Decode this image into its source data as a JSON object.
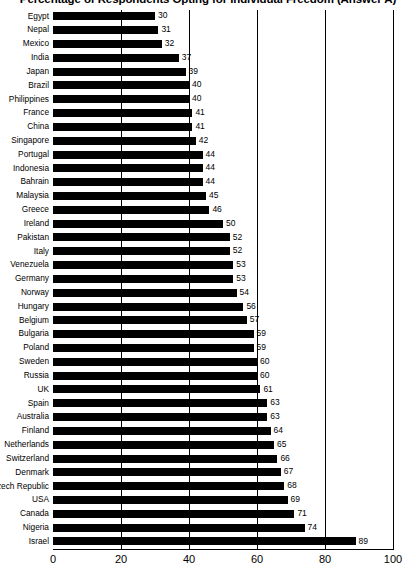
{
  "chart_data": {
    "type": "bar",
    "orientation": "horizontal",
    "title": "Percentage of Respondents Opting for Individual Freedom (Answer A)",
    "xlabel": "",
    "ylabel": "",
    "xlim": [
      0,
      100
    ],
    "xticks": [
      0,
      20,
      40,
      60,
      80,
      100
    ],
    "grid": true,
    "grid_axis": "x",
    "legend": false,
    "bar_color": "#000000",
    "background_color": "#ffffff",
    "show_value_labels": true,
    "categories": [
      "Egypt",
      "Nepal",
      "Mexico",
      "India",
      "Japan",
      "Brazil",
      "Philippines",
      "France",
      "China",
      "Singapore",
      "Portugal",
      "Indonesia",
      "Bahrain",
      "Malaysia",
      "Greece",
      "Ireland",
      "Pakistan",
      "Italy",
      "Venezuela",
      "Germany",
      "Norway",
      "Hungary",
      "Belgium",
      "Bulgaria",
      "Poland",
      "Sweden",
      "Russia",
      "UK",
      "Spain",
      "Australia",
      "Finland",
      "Netherlands",
      "Switzerland",
      "Denmark",
      "Czech Republic",
      "USA",
      "Canada",
      "Nigeria",
      "Israel"
    ],
    "values": [
      30,
      31,
      32,
      37,
      39,
      40,
      40,
      41,
      41,
      42,
      44,
      44,
      44,
      45,
      46,
      50,
      52,
      52,
      53,
      53,
      54,
      56,
      57,
      59,
      59,
      60,
      60,
      61,
      63,
      63,
      64,
      65,
      66,
      67,
      68,
      69,
      71,
      74,
      89
    ]
  }
}
